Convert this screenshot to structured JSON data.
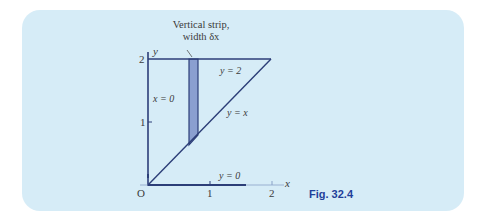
{
  "figure": {
    "caption": "Fig. 32.4",
    "annotation": {
      "line1": "Vertical strip,",
      "line2": "width δx"
    },
    "axes": {
      "x_label": "x",
      "y_label": "y",
      "origin_label": "O",
      "x_ticks": [
        "1",
        "2"
      ],
      "y_ticks": [
        "1",
        "2"
      ]
    },
    "line_labels": {
      "top": "y = 2",
      "diagonal": "y = x",
      "left": "x = 0",
      "bottom": "y = 0"
    },
    "colors": {
      "panel": "#d6ecf7",
      "line": "#2c3e78",
      "strip_fill": "#8a9fd0",
      "caption": "#1f3f9a",
      "text": "#3a3a3a"
    }
  }
}
